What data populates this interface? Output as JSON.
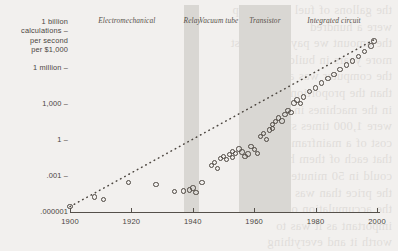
{
  "page": {
    "background_color": "#f2f0ee",
    "ink_color": "#4a453f",
    "band_color": "#d9d7d3",
    "marker_color": "#4d4741",
    "bleed_text": "the gallons of fuel for the trip\nwere a hundred\nthe amount we pay in the first\nmore years in building and\nthe computer was a very\nthan the proportion that\nin the machines in one\nwere 1,000 times smaller\ncost of a mainframe in\nthat each of them had\ncould in 50 minutes, so\nthe price than was the\nthe accumulation of all\nimportant as it was to\nworth it and everything\nthe power of a billion\nlaw has been driving this"
  },
  "chart_data": {
    "type": "scatter",
    "title": "",
    "xlabel": "",
    "ylabel": "1 billion calculations per second per $1,000",
    "xlim": [
      1900,
      2000
    ],
    "ylim_log10": [
      -6,
      9
    ],
    "y_scale": "log",
    "grid": false,
    "legend": "none",
    "x_ticks": [
      "1900",
      "1920",
      "1940",
      "1960",
      "1980",
      "2000"
    ],
    "x_tick_values": [
      1900,
      1920,
      1940,
      1960,
      1980,
      2000
    ],
    "y_ticks": [
      {
        "label": "1 billion\ncalculations –\nper second\nper $1,000",
        "log10": 9
      },
      {
        "label": "1 million –",
        "log10": 6
      },
      {
        "label": "1,000 –",
        "log10": 3
      },
      {
        "label": "1 –",
        "log10": 0
      },
      {
        "label": ".001 –",
        "log10": -3
      },
      {
        "label": ".000001",
        "log10": -6
      }
    ],
    "eras": [
      {
        "label": "Electromechanical",
        "start": 1900,
        "end": 1937,
        "shaded": false
      },
      {
        "label": "Relay",
        "start": 1937,
        "end": 1942,
        "shaded": true
      },
      {
        "label": "Vacuum\ntube",
        "start": 1942,
        "end": 1955,
        "shaded": false
      },
      {
        "label": "Transistor",
        "start": 1955,
        "end": 1972,
        "shaded": true
      },
      {
        "label": "Integrated\ncircuit",
        "start": 1972,
        "end": 2000,
        "shaded": false
      }
    ],
    "trendline": {
      "style": "dotted",
      "from": [
        1900,
        -5.55
      ],
      "to": [
        1999,
        8.35
      ]
    },
    "points": [
      [
        1900,
        -5.55
      ],
      [
        1908,
        -4.75
      ],
      [
        1911,
        -4.95
      ],
      [
        1919,
        -3.55
      ],
      [
        1928,
        -3.7
      ],
      [
        1934,
        -4.3
      ],
      [
        1937,
        -4.25
      ],
      [
        1939,
        -4.15
      ],
      [
        1940,
        -4.0
      ],
      [
        1941,
        -4.35
      ],
      [
        1943,
        -3.55
      ],
      [
        1946,
        -2.1
      ],
      [
        1947,
        -1.85
      ],
      [
        1948,
        -2.35
      ],
      [
        1949,
        -1.55
      ],
      [
        1950,
        -1.35
      ],
      [
        1951,
        -1.6
      ],
      [
        1952,
        -1.2
      ],
      [
        1953,
        -0.95
      ],
      [
        1953,
        -1.45
      ],
      [
        1954,
        -1.1
      ],
      [
        1955,
        -0.75
      ],
      [
        1956,
        -1.0
      ],
      [
        1957,
        -1.35
      ],
      [
        1958,
        -1.15
      ],
      [
        1959,
        -0.55
      ],
      [
        1960,
        -0.8
      ],
      [
        1961,
        -1.1
      ],
      [
        1962,
        0.3
      ],
      [
        1963,
        0.55
      ],
      [
        1964,
        0.05
      ],
      [
        1965,
        0.85
      ],
      [
        1966,
        1.3
      ],
      [
        1966,
        0.95
      ],
      [
        1967,
        1.55
      ],
      [
        1968,
        1.85
      ],
      [
        1969,
        1.6
      ],
      [
        1970,
        2.15
      ],
      [
        1971,
        2.45
      ],
      [
        1972,
        2.3
      ],
      [
        1973,
        3.1
      ],
      [
        1974,
        3.35
      ],
      [
        1975,
        3.05
      ],
      [
        1976,
        3.6
      ],
      [
        1978,
        4.05
      ],
      [
        1980,
        4.35
      ],
      [
        1982,
        4.75
      ],
      [
        1984,
        5.15
      ],
      [
        1986,
        5.45
      ],
      [
        1988,
        5.9
      ],
      [
        1990,
        6.25
      ],
      [
        1992,
        6.6
      ],
      [
        1994,
        6.95
      ],
      [
        1996,
        7.4
      ],
      [
        1998,
        7.85
      ],
      [
        1999,
        8.25
      ]
    ]
  }
}
